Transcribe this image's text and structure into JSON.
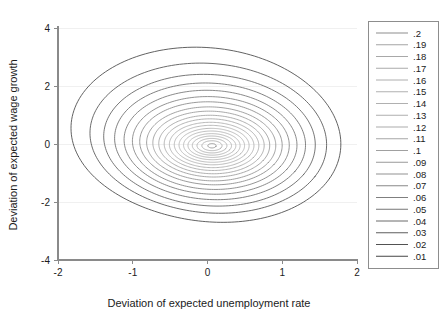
{
  "chart_data": {
    "type": "line",
    "subtype": "contour",
    "title": "",
    "xlabel": "Deviation of expected unemployment rate",
    "ylabel": "Deviation of expected wage growth",
    "xlim": [
      -2,
      2
    ],
    "ylim": [
      -4,
      4
    ],
    "xticks": [
      -2,
      -1,
      0,
      1,
      2
    ],
    "xtick_labels": [
      "-2",
      "-1",
      "0",
      "1",
      "2"
    ],
    "yticks": [
      -4,
      -2,
      0,
      2,
      4
    ],
    "ytick_labels": [
      "-4",
      "-2",
      "0",
      "2",
      "4"
    ],
    "grid": "horizontal",
    "legend_position": "right-outside",
    "legend_title": "",
    "center": [
      0.06,
      -0.06
    ],
    "levels": [
      {
        "label": ".2",
        "value": 0.2,
        "color": "#8d8d8d",
        "rx": 0.055,
        "ry": 0.075,
        "tilt": -0.48,
        "lobe": 0.0
      },
      {
        "label": ".19",
        "value": 0.19,
        "color": "#a5a5a5",
        "rx": 0.135,
        "ry": 0.17,
        "tilt": -0.48,
        "lobe": 0.01
      },
      {
        "label": ".18",
        "value": 0.18,
        "color": "#a8a8a8",
        "rx": 0.2,
        "ry": 0.25,
        "tilt": -0.48,
        "lobe": 0.01
      },
      {
        "label": ".17",
        "value": 0.17,
        "color": "#ababab",
        "rx": 0.262,
        "ry": 0.33,
        "tilt": -0.48,
        "lobe": 0.02
      },
      {
        "label": ".16",
        "value": 0.16,
        "color": "#aeaeae",
        "rx": 0.32,
        "ry": 0.41,
        "tilt": -0.48,
        "lobe": 0.02
      },
      {
        "label": ".15",
        "value": 0.15,
        "color": "#b0b0b0",
        "rx": 0.378,
        "ry": 0.495,
        "tilt": -0.48,
        "lobe": 0.03
      },
      {
        "label": ".14",
        "value": 0.14,
        "color": "#b0b0b0",
        "rx": 0.438,
        "ry": 0.585,
        "tilt": -0.48,
        "lobe": 0.03
      },
      {
        "label": ".13",
        "value": 0.13,
        "color": "#aeaeae",
        "rx": 0.5,
        "ry": 0.68,
        "tilt": -0.48,
        "lobe": 0.04
      },
      {
        "label": ".12",
        "value": 0.12,
        "color": "#ababab",
        "rx": 0.565,
        "ry": 0.782,
        "tilt": -0.48,
        "lobe": 0.04
      },
      {
        "label": ".11",
        "value": 0.11,
        "color": "#a6a6a6",
        "rx": 0.632,
        "ry": 0.89,
        "tilt": -0.48,
        "lobe": 0.05
      },
      {
        "label": ".1",
        "value": 0.1,
        "color": "#a0a0a0",
        "rx": 0.704,
        "ry": 1.008,
        "tilt": -0.48,
        "lobe": 0.05
      },
      {
        "label": ".09",
        "value": 0.09,
        "color": "#999999",
        "rx": 0.78,
        "ry": 1.135,
        "tilt": -0.48,
        "lobe": 0.06
      },
      {
        "label": ".08",
        "value": 0.08,
        "color": "#919191",
        "rx": 0.862,
        "ry": 1.275,
        "tilt": -0.48,
        "lobe": 0.06
      },
      {
        "label": ".07",
        "value": 0.07,
        "color": "#888888",
        "rx": 0.95,
        "ry": 1.43,
        "tilt": -0.48,
        "lobe": 0.07
      },
      {
        "label": ".06",
        "value": 0.06,
        "color": "#7f7f7f",
        "rx": 1.046,
        "ry": 1.6,
        "tilt": -0.48,
        "lobe": 0.07
      },
      {
        "label": ".05",
        "value": 0.05,
        "color": "#757575",
        "rx": 1.152,
        "ry": 1.79,
        "tilt": -0.48,
        "lobe": 0.08
      },
      {
        "label": ".04",
        "value": 0.04,
        "color": "#6a6a6a",
        "rx": 1.27,
        "ry": 2.01,
        "tilt": -0.47,
        "lobe": 0.09
      },
      {
        "label": ".03",
        "value": 0.03,
        "color": "#5e5e5e",
        "rx": 1.405,
        "ry": 2.27,
        "tilt": -0.46,
        "lobe": 0.1
      },
      {
        "label": ".02",
        "value": 0.02,
        "color": "#525252",
        "rx": 1.565,
        "ry": 2.59,
        "tilt": -0.44,
        "lobe": 0.12
      },
      {
        "label": ".01",
        "value": 0.01,
        "color": "#464646",
        "rx": 1.77,
        "ry": 3.03,
        "tilt": -0.4,
        "lobe": 0.15
      }
    ]
  },
  "axes": {
    "x_title": "Deviation of expected unemployment rate",
    "y_title": "Deviation of expected wage growth"
  },
  "legend": {
    "items": [
      {
        "label": ".2"
      },
      {
        "label": ".19"
      },
      {
        "label": ".18"
      },
      {
        "label": ".17"
      },
      {
        "label": ".16"
      },
      {
        "label": ".15"
      },
      {
        "label": ".14"
      },
      {
        "label": ".13"
      },
      {
        "label": ".12"
      },
      {
        "label": ".11"
      },
      {
        "label": ".1"
      },
      {
        "label": ".09"
      },
      {
        "label": ".08"
      },
      {
        "label": ".07"
      },
      {
        "label": ".06"
      },
      {
        "label": ".05"
      },
      {
        "label": ".04"
      },
      {
        "label": ".03"
      },
      {
        "label": ".02"
      },
      {
        "label": ".01"
      }
    ]
  },
  "colors": {
    "background": "#ffffff",
    "spine": "#8a8a8a",
    "grid": "#f0f0f0",
    "text": "#1b1b1b",
    "legend_border": "#8d8d8d"
  }
}
